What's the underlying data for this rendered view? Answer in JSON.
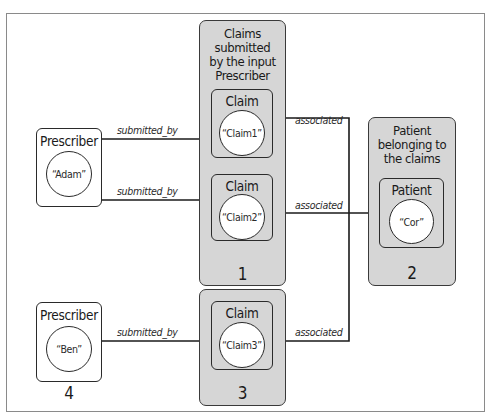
{
  "diagram": {
    "groups": {
      "claims_by_prescriber": {
        "title": "Claims submitted by the input Prescriber",
        "title_lines": [
          "Claims",
          "submitted",
          "by the input",
          "Prescriber"
        ],
        "number": "1"
      },
      "patient_group": {
        "title": "Patient belonging to the claims",
        "title_lines": [
          "Patient",
          "belonging to",
          "the claims"
        ],
        "number": "2"
      },
      "claim3_group": {
        "number": "3"
      },
      "prescriber_ben_group": {
        "number": "4"
      }
    },
    "nodes": {
      "prescriber_adam": {
        "type": "Prescriber",
        "value": "“Adam”"
      },
      "prescriber_ben": {
        "type": "Prescriber",
        "value": "“Ben”"
      },
      "claim1": {
        "type": "Claim",
        "value": "“Claim1”"
      },
      "claim2": {
        "type": "Claim",
        "value": "“Claim2”"
      },
      "claim3": {
        "type": "Claim",
        "value": "“Claim3”"
      },
      "patient_cor": {
        "type": "Patient",
        "value": "“Cor”"
      }
    },
    "edges": [
      {
        "from": "prescriber_adam",
        "to": "claim1",
        "label": "submitted_by"
      },
      {
        "from": "prescriber_adam",
        "to": "claim2",
        "label": "submitted_by"
      },
      {
        "from": "prescriber_ben",
        "to": "claim3",
        "label": "submitted_by"
      },
      {
        "from": "claim1",
        "to": "patient_cor",
        "label": "associated"
      },
      {
        "from": "claim2",
        "to": "patient_cor",
        "label": "associated"
      },
      {
        "from": "claim3",
        "to": "patient_cor",
        "label": "associated"
      }
    ],
    "colors": {
      "group_fill": "#d6d6d6",
      "stroke": "#2a2a2a",
      "frame": "#8a8a8a"
    }
  }
}
